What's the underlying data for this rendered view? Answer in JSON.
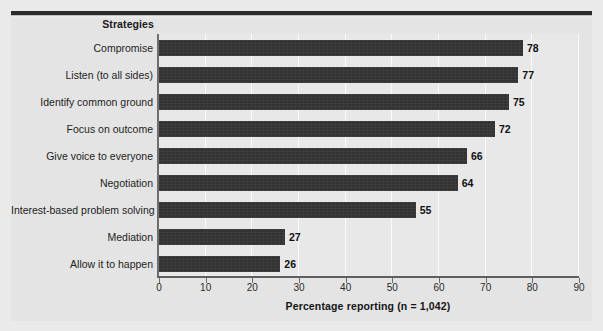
{
  "figure": {
    "panel_bg": "#e4e4e4",
    "rule_color": "#2b2b2b",
    "bar_color": "#333333",
    "top_caption_fragment": ""
  },
  "chart_data": {
    "type": "bar",
    "orientation": "horizontal",
    "title": "",
    "category_axis_title": "Strategies",
    "xlabel": "Percentage reporting (n = 1,042)",
    "ylabel": "Strategies",
    "xlim": [
      0,
      90
    ],
    "xticks": [
      "0",
      "10",
      "20",
      "30",
      "40",
      "50",
      "60",
      "70",
      "80",
      "90"
    ],
    "grid": "vertical-gridlines-only",
    "legend": "none",
    "n": "1,042",
    "categories": [
      "Compromise",
      "Listen (to all sides)",
      "Identify common ground",
      "Focus on outcome",
      "Give voice to everyone",
      "Negotiation",
      "Interest-based problem solving",
      "Mediation",
      "Allow it to happen"
    ],
    "values": [
      78,
      77,
      75,
      72,
      66,
      64,
      55,
      27,
      26
    ],
    "value_labels": [
      "78",
      "77",
      "75",
      "72",
      "66",
      "64",
      "55",
      "27",
      "26"
    ]
  }
}
